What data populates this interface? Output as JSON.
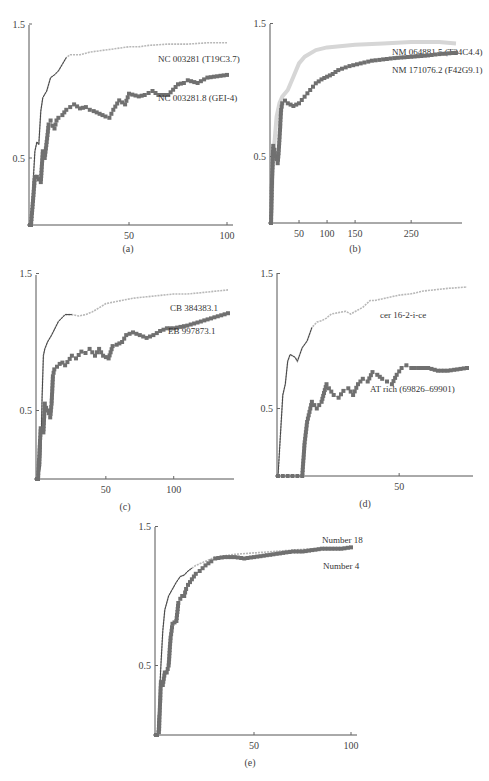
{
  "figure": {
    "panels": [
      {
        "id": "a",
        "caption": "(a)"
      },
      {
        "id": "b",
        "caption": "(b)"
      },
      {
        "id": "c",
        "caption": "(c)"
      },
      {
        "id": "d",
        "caption": "(d)"
      },
      {
        "id": "e",
        "caption": "(e)"
      }
    ]
  },
  "colors": {
    "upper_series": "#b8b8b8",
    "upper_series_dark": "#444444",
    "lower_series": "#707070",
    "axis": "#555555"
  },
  "chart_data": [
    {
      "panel": "a",
      "type": "line",
      "caption": "(a)",
      "ylim": [
        0,
        1.5
      ],
      "yticks": [
        0.5,
        1.5
      ],
      "ytick_labels": [
        "0.5",
        "1.5"
      ],
      "xlim": [
        0,
        100
      ],
      "xticks": [
        50,
        100
      ],
      "xtick_labels": [
        "50",
        "100"
      ],
      "xlabel": "",
      "ylabel": "",
      "series": [
        {
          "name": "NC 003281 (T19C3.7)",
          "style": "line",
          "x": [
            0,
            1,
            2,
            3,
            4,
            5,
            6,
            8,
            10,
            12,
            14,
            16,
            18,
            20,
            25,
            30,
            35,
            40,
            45,
            50,
            55,
            60,
            70,
            80,
            90,
            100
          ],
          "y": [
            0,
            0.3,
            0.55,
            0.62,
            0.6,
            0.85,
            0.95,
            1.0,
            1.1,
            1.12,
            1.15,
            1.2,
            1.25,
            1.27,
            1.27,
            1.29,
            1.3,
            1.31,
            1.32,
            1.33,
            1.33,
            1.34,
            1.35,
            1.35,
            1.36,
            1.36
          ]
        },
        {
          "name": "NC 003281.8 (GEI-4)",
          "style": "markers",
          "x": [
            0,
            2,
            3,
            4,
            5,
            6,
            7,
            8,
            9,
            10,
            11,
            12,
            13,
            14,
            16,
            18,
            20,
            22,
            25,
            28,
            30,
            32,
            35,
            38,
            40,
            42,
            45,
            48,
            50,
            55,
            58,
            62,
            65,
            70,
            75,
            78,
            80,
            85,
            90,
            95,
            100
          ],
          "y": [
            0,
            0.36,
            0.36,
            0.34,
            0.32,
            0.55,
            0.5,
            0.62,
            0.75,
            0.78,
            0.74,
            0.72,
            0.78,
            0.8,
            0.82,
            0.86,
            0.88,
            0.9,
            0.87,
            0.88,
            0.86,
            0.85,
            0.83,
            0.81,
            0.8,
            0.86,
            0.93,
            0.9,
            0.98,
            0.96,
            0.97,
            1.0,
            0.97,
            0.97,
            1.05,
            1.06,
            1.08,
            1.06,
            1.1,
            1.11,
            1.12
          ]
        }
      ]
    },
    {
      "panel": "b",
      "type": "line",
      "caption": "(b)",
      "ylim": [
        0,
        1.5
      ],
      "yticks": [
        0.5,
        1.5
      ],
      "ytick_labels": [
        "0.5",
        "1.5"
      ],
      "xlim": [
        0,
        330
      ],
      "xticks": [
        50,
        100,
        150,
        250
      ],
      "xtick_labels": [
        "50",
        "100",
        "150",
        "250"
      ],
      "xlabel": "",
      "ylabel": "",
      "series": [
        {
          "name": "NM 064881.5 (T24C4.4)",
          "style": "thick-light-line",
          "x": [
            0,
            3,
            6,
            10,
            15,
            20,
            30,
            40,
            50,
            60,
            80,
            100,
            150,
            200,
            250,
            300,
            330
          ],
          "y": [
            0,
            0.4,
            0.6,
            0.8,
            0.9,
            0.95,
            1.0,
            1.1,
            1.2,
            1.25,
            1.3,
            1.32,
            1.34,
            1.35,
            1.36,
            1.36,
            1.35
          ]
        },
        {
          "name": "NM 171076.2 (F42G9.1)",
          "style": "markers",
          "x": [
            0,
            2,
            4,
            6,
            8,
            10,
            12,
            14,
            16,
            18,
            20,
            25,
            30,
            40,
            50,
            60,
            70,
            80,
            90,
            100,
            110,
            120,
            140,
            160,
            180,
            200,
            220,
            250,
            280,
            300,
            330
          ],
          "y": [
            0,
            0.35,
            0.58,
            0.55,
            0.5,
            0.48,
            0.45,
            0.55,
            0.7,
            0.85,
            0.9,
            0.92,
            0.9,
            0.88,
            0.9,
            0.95,
            1.0,
            1.05,
            1.08,
            1.1,
            1.12,
            1.15,
            1.18,
            1.2,
            1.22,
            1.23,
            1.24,
            1.25,
            1.26,
            1.27,
            1.28
          ]
        }
      ]
    },
    {
      "panel": "c",
      "type": "line",
      "caption": "(c)",
      "ylim": [
        0,
        1.5
      ],
      "yticks": [
        0.5,
        1.5
      ],
      "ytick_labels": [
        "0.5",
        "1.5"
      ],
      "xlim": [
        0,
        140
      ],
      "xticks": [
        50,
        100
      ],
      "xtick_labels": [
        "50",
        "100"
      ],
      "xlabel": "",
      "ylabel": "",
      "series": [
        {
          "name": "CB 384383.1",
          "style": "line",
          "x": [
            0,
            2,
            3,
            4,
            5,
            7,
            10,
            15,
            20,
            25,
            30,
            35,
            40,
            45,
            50,
            60,
            70,
            80,
            90,
            100,
            110,
            120,
            130,
            140
          ],
          "y": [
            0,
            0.1,
            0.6,
            0.9,
            0.95,
            1.0,
            1.05,
            1.15,
            1.2,
            1.2,
            1.19,
            1.2,
            1.22,
            1.25,
            1.28,
            1.3,
            1.32,
            1.33,
            1.34,
            1.35,
            1.35,
            1.36,
            1.37,
            1.38
          ]
        },
        {
          "name": "EB 997873.1",
          "style": "markers",
          "x": [
            0,
            2,
            4,
            5,
            6,
            7,
            8,
            9,
            10,
            11,
            12,
            14,
            16,
            18,
            20,
            25,
            28,
            32,
            35,
            38,
            42,
            45,
            48,
            52,
            55,
            58,
            62,
            65,
            70,
            75,
            80,
            85,
            90,
            95,
            100,
            110,
            120,
            130,
            140
          ],
          "y": [
            0,
            0.37,
            0.34,
            0.55,
            0.52,
            0.5,
            0.48,
            0.45,
            0.55,
            0.75,
            0.8,
            0.82,
            0.84,
            0.85,
            0.83,
            0.9,
            0.88,
            0.93,
            0.92,
            0.95,
            0.9,
            0.95,
            0.9,
            0.88,
            0.97,
            0.98,
            1.0,
            1.05,
            1.07,
            1.05,
            1.03,
            1.05,
            1.08,
            1.1,
            1.1,
            1.12,
            1.15,
            1.18,
            1.21
          ]
        }
      ]
    },
    {
      "panel": "d",
      "type": "line",
      "caption": "(d)",
      "ylim": [
        0,
        1.5
      ],
      "yticks": [
        0.5,
        1.5
      ],
      "ytick_labels": [
        "0.5",
        "1.5"
      ],
      "xlim": [
        0,
        78
      ],
      "xticks": [
        50
      ],
      "xtick_labels": [
        "50"
      ],
      "xlabel": "",
      "ylabel": "",
      "series": [
        {
          "name": "cer 16-2-i-ce",
          "style": "line",
          "x": [
            0,
            1,
            2,
            3,
            4,
            5,
            7,
            8,
            9,
            10,
            12,
            14,
            16,
            18,
            20,
            22,
            25,
            28,
            30,
            35,
            38,
            40,
            45,
            50,
            55,
            60,
            65,
            70,
            78
          ],
          "y": [
            0,
            0.3,
            0.6,
            0.68,
            0.85,
            0.9,
            0.88,
            0.85,
            0.9,
            0.95,
            1.0,
            1.1,
            1.14,
            1.15,
            1.17,
            1.2,
            1.21,
            1.22,
            1.2,
            1.25,
            1.3,
            1.3,
            1.32,
            1.34,
            1.35,
            1.37,
            1.38,
            1.39,
            1.4
          ]
        },
        {
          "name": "AT rich (69826–69901)",
          "style": "markers",
          "x": [
            0,
            2,
            4,
            6,
            8,
            10,
            11,
            12,
            14,
            16,
            18,
            20,
            21,
            23,
            25,
            27,
            29,
            31,
            33,
            35,
            37,
            39,
            41,
            43,
            45,
            47,
            49,
            51,
            53,
            55,
            58,
            62,
            66,
            70,
            74,
            78
          ],
          "y": [
            0,
            0,
            0,
            0,
            0,
            0,
            0.25,
            0.4,
            0.55,
            0.5,
            0.55,
            0.68,
            0.65,
            0.6,
            0.58,
            0.63,
            0.65,
            0.6,
            0.68,
            0.72,
            0.7,
            0.77,
            0.75,
            0.72,
            0.7,
            0.68,
            0.75,
            0.8,
            0.82,
            0.8,
            0.8,
            0.8,
            0.78,
            0.78,
            0.79,
            0.8
          ]
        }
      ]
    },
    {
      "panel": "e",
      "type": "line",
      "caption": "(e)",
      "ylim": [
        0,
        1.5
      ],
      "yticks": [
        0.5,
        1.5
      ],
      "ytick_labels": [
        "0.5",
        "1.5"
      ],
      "xlim": [
        0,
        100
      ],
      "xticks": [
        50,
        100
      ],
      "xtick_labels": [
        "50",
        "100"
      ],
      "xlabel": "",
      "ylabel": "",
      "series": [
        {
          "name": "Number 18",
          "style": "line",
          "x": [
            0,
            1,
            2,
            3,
            4,
            5,
            6,
            8,
            10,
            12,
            14,
            16,
            18,
            20,
            25,
            30,
            40,
            50,
            60,
            70,
            80,
            90,
            100
          ],
          "y": [
            0,
            0.2,
            0.5,
            0.75,
            0.9,
            0.95,
            1.0,
            1.05,
            1.1,
            1.14,
            1.15,
            1.18,
            1.2,
            1.22,
            1.25,
            1.28,
            1.3,
            1.31,
            1.32,
            1.33,
            1.34,
            1.34,
            1.35
          ]
        },
        {
          "name": "Number 4",
          "style": "markers",
          "x": [
            0,
            1,
            2,
            3,
            4,
            5,
            6,
            7,
            8,
            9,
            10,
            11,
            12,
            13,
            14,
            15,
            16,
            17,
            18,
            20,
            22,
            25,
            28,
            30,
            35,
            40,
            45,
            50,
            55,
            60,
            65,
            70,
            75,
            80,
            85,
            90,
            95,
            100
          ],
          "y": [
            0,
            0.02,
            0.38,
            0.36,
            0.45,
            0.45,
            0.5,
            0.7,
            0.8,
            0.81,
            0.82,
            0.95,
            0.98,
            1.0,
            1.0,
            1.05,
            1.08,
            1.1,
            1.12,
            1.16,
            1.18,
            1.22,
            1.25,
            1.27,
            1.28,
            1.28,
            1.27,
            1.28,
            1.29,
            1.3,
            1.31,
            1.32,
            1.32,
            1.33,
            1.34,
            1.34,
            1.34,
            1.35
          ]
        }
      ]
    }
  ],
  "layout": {
    "panels": [
      {
        "x0": 31,
        "x1": 227,
        "xmax": 100,
        "y0": 225,
        "ppu": 134,
        "axis_x": 29,
        "axis_top": 25,
        "caption_y": 252,
        "caption_x": 128,
        "labels": [
          {
            "x": 158,
            "y": 62
          },
          {
            "x": 158,
            "y": 101
          }
        ]
      },
      {
        "x0": 271,
        "x1": 456,
        "xmax": 330,
        "y0": 223,
        "ppu": 133,
        "axis_x": 270,
        "axis_top": 24,
        "caption_y": 252,
        "caption_x": 355,
        "labels": [
          {
            "x": 392,
            "y": 55
          },
          {
            "x": 392,
            "y": 73
          }
        ]
      },
      {
        "x0": 38,
        "x1": 228,
        "xmax": 140,
        "y0": 479,
        "ppu": 137,
        "axis_x": 36,
        "axis_top": 275,
        "caption_y": 510,
        "caption_x": 125,
        "labels": [
          {
            "x": 170,
            "y": 311
          },
          {
            "x": 168,
            "y": 334
          }
        ]
      },
      {
        "x0": 278,
        "x1": 467,
        "xmax": 78,
        "y0": 476,
        "ppu": 135,
        "axis_x": 277,
        "axis_top": 273,
        "caption_y": 507,
        "caption_x": 365,
        "labels": [
          {
            "x": 380,
            "y": 318
          },
          {
            "x": 370,
            "y": 392
          }
        ]
      },
      {
        "x0": 157,
        "x1": 351,
        "xmax": 100,
        "y0": 735,
        "ppu": 139,
        "axis_x": 155,
        "axis_top": 527,
        "caption_y": 766,
        "caption_x": 250,
        "labels": [
          {
            "x": 322,
            "y": 543
          },
          {
            "x": 323,
            "y": 569
          }
        ]
      }
    ]
  }
}
